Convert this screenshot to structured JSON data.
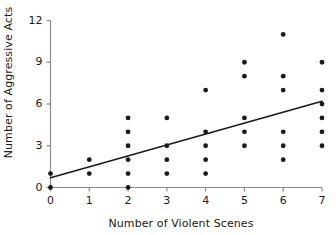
{
  "chart_data": {
    "type": "scatter",
    "title": "",
    "xlabel": "Number of Violent Scenes",
    "ylabel": "Number of Aggressive Acts",
    "xlim": [
      0,
      7
    ],
    "ylim": [
      0,
      12
    ],
    "xticks": [
      0,
      1,
      2,
      3,
      4,
      5,
      6,
      7
    ],
    "yticks": [
      0,
      3,
      6,
      9,
      12
    ],
    "xtick_labels": [
      "0",
      "1",
      "2",
      "3",
      "4",
      "5",
      "6",
      "7"
    ],
    "ytick_labels": [
      "0",
      "3",
      "6",
      "9",
      "12"
    ],
    "grid": false,
    "legend": false,
    "marker_color": "#1a1a1a",
    "marker_shape": "circle",
    "axis_color": "#8a8a8a",
    "trendline_color": "#1a1a1a",
    "points": [
      {
        "x": 0,
        "y": 0
      },
      {
        "x": 0,
        "y": 1
      },
      {
        "x": 1,
        "y": 1
      },
      {
        "x": 1,
        "y": 2
      },
      {
        "x": 2,
        "y": 0
      },
      {
        "x": 2,
        "y": 1
      },
      {
        "x": 2,
        "y": 2
      },
      {
        "x": 2,
        "y": 3
      },
      {
        "x": 2,
        "y": 4
      },
      {
        "x": 2,
        "y": 5
      },
      {
        "x": 3,
        "y": 1
      },
      {
        "x": 3,
        "y": 2
      },
      {
        "x": 3,
        "y": 3
      },
      {
        "x": 3,
        "y": 5
      },
      {
        "x": 4,
        "y": 1
      },
      {
        "x": 4,
        "y": 2
      },
      {
        "x": 4,
        "y": 3
      },
      {
        "x": 4,
        "y": 4
      },
      {
        "x": 4,
        "y": 7
      },
      {
        "x": 5,
        "y": 3
      },
      {
        "x": 5,
        "y": 4
      },
      {
        "x": 5,
        "y": 5
      },
      {
        "x": 5,
        "y": 8
      },
      {
        "x": 5,
        "y": 9
      },
      {
        "x": 6,
        "y": 2
      },
      {
        "x": 6,
        "y": 3
      },
      {
        "x": 6,
        "y": 4
      },
      {
        "x": 6,
        "y": 7
      },
      {
        "x": 6,
        "y": 8
      },
      {
        "x": 6,
        "y": 11
      },
      {
        "x": 7,
        "y": 3
      },
      {
        "x": 7,
        "y": 4
      },
      {
        "x": 7,
        "y": 5
      },
      {
        "x": 7,
        "y": 6
      },
      {
        "x": 7,
        "y": 7
      },
      {
        "x": 7,
        "y": 9
      }
    ],
    "trendline": {
      "x0": 0,
      "y0": 0.7,
      "x1": 7,
      "y1": 6.2
    }
  }
}
